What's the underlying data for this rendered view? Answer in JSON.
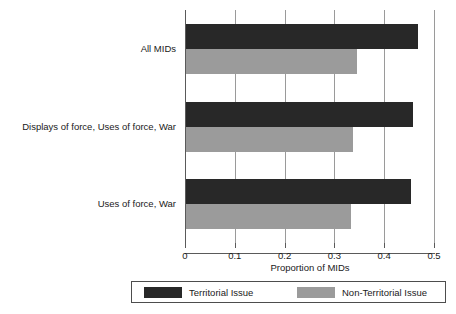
{
  "chart_data": {
    "type": "bar",
    "orientation": "horizontal",
    "title": "",
    "xlabel": "Proportion of MIDs",
    "ylabel": "",
    "xlim": [
      0,
      0.5
    ],
    "xticks": [
      0,
      0.1,
      0.2,
      0.3,
      0.4,
      0.5
    ],
    "xticklabels": [
      "0",
      "0.1",
      "0.2",
      "0.3",
      "0.4",
      "0.5"
    ],
    "grid": "vertical",
    "legend_position": "bottom",
    "categories": [
      "All MIDs",
      "Displays of force, Uses of force, War",
      "Uses of force, War"
    ],
    "series": [
      {
        "name": "Territorial Issue",
        "color": "#282828",
        "values": [
          0.466,
          0.456,
          0.452
        ]
      },
      {
        "name": "Non-Territorial Issue",
        "color": "#9b9b9b",
        "values": [
          0.343,
          0.335,
          0.331
        ]
      }
    ]
  },
  "axis": {
    "xlabel": "Proportion of MIDs"
  },
  "legend": {
    "entries": [
      {
        "label": "Territorial Issue",
        "color": "#282828"
      },
      {
        "label": "Non-Territorial Issue",
        "color": "#9b9b9b"
      }
    ]
  }
}
